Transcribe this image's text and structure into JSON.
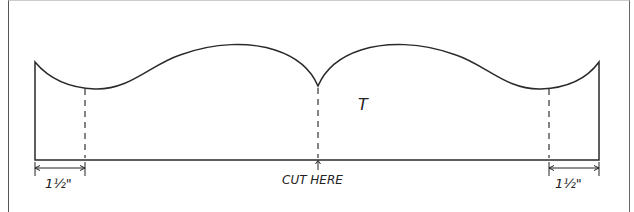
{
  "diagram": {
    "center_letter": "T",
    "cut_label": "CUT HERE",
    "left_dimension": "1½\"",
    "right_dimension": "1½\"",
    "line_color": "#2a2a2a"
  }
}
